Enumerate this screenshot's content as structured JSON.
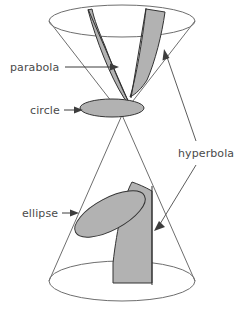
{
  "figure": {
    "type": "geometry-diagram",
    "background_color": "#ffffff"
  },
  "colors": {
    "outline": "#6e6e6e",
    "section_fill": "#b2b2b2",
    "section_edge": "#333333",
    "label_text": "#4a4a4a",
    "leader": "#3d3d3d"
  },
  "labels": {
    "parabola": "parabola",
    "circle": "circle",
    "ellipse": "ellipse",
    "hyperbola": "hyperbola"
  },
  "sections": [
    {
      "name": "parabola",
      "label": "parabola",
      "cone": "upper",
      "description": "plane parallel to one generator cutting the upper nappe"
    },
    {
      "name": "circle",
      "label": "circle",
      "cone": "upper",
      "description": "plane perpendicular to the axis cutting the upper nappe"
    },
    {
      "name": "hyperbola-upper",
      "label": "hyperbola",
      "cone": "upper",
      "description": "upper branch of a plane parallel to the axis"
    },
    {
      "name": "ellipse",
      "label": "ellipse",
      "cone": "lower",
      "description": "oblique plane cutting the lower nappe"
    },
    {
      "name": "hyperbola-lower",
      "label": "hyperbola",
      "cone": "lower",
      "description": "lower branch of a plane parallel to the axis"
    }
  ]
}
